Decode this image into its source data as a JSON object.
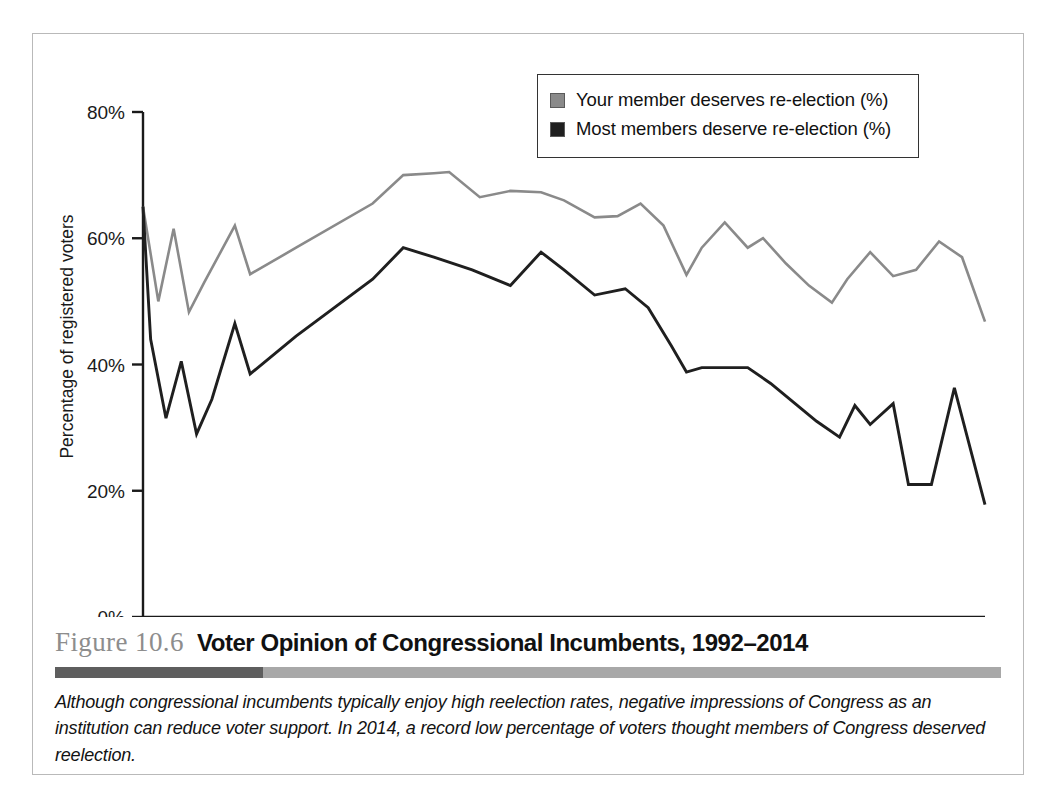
{
  "figure": {
    "number": "Figure 10.6",
    "title": "Voter Opinion of Congressional Incumbents, 1992–2014",
    "caption": "Although congressional incumbents typically enjoy high reelection rates, negative impressions of Congress as an institution can reduce voter support. In 2014, a record low percentage of voters thought members of Congress deserved reelection.",
    "rule_dark_color": "#5e5e5e",
    "rule_light_color": "#a8a8a8"
  },
  "legend": {
    "items": [
      {
        "label": "Your member deserves re-election (%)",
        "color": "#8a8a8a"
      },
      {
        "label": "Most members deserve re-election (%)",
        "color": "#1f1f1f"
      }
    ]
  },
  "chart_data": {
    "type": "line",
    "title": "Voter Opinion of Congressional Incumbents, 1992–2014",
    "xlabel": "",
    "ylabel": "Percentage of registered voters",
    "xlim": [
      1992,
      2014
    ],
    "ylim": [
      0,
      80
    ],
    "yticks": [
      0,
      20,
      40,
      60,
      80
    ],
    "ytick_labels": [
      "0%",
      "20%",
      "40%",
      "60%",
      "80%"
    ],
    "xticks": [
      1992,
      1994,
      1996,
      1998,
      2000,
      2002,
      2004,
      2006,
      2008,
      2010,
      2012,
      2014
    ],
    "xtick_labels": [
      "1992",
      "1994",
      "1996",
      "1998",
      "2000",
      "2002",
      "2004",
      "2006",
      "2008",
      "2010",
      "2012",
      "2014"
    ],
    "grid": false,
    "legend_position": "top-right",
    "series": [
      {
        "name": "Your member deserves re-election (%)",
        "color": "#8a8a8a",
        "x": [
          1992.0,
          1992.4,
          1992.8,
          1993.2,
          1993.6,
          1994.4,
          1994.8,
          1996.0,
          1998.0,
          1998.8,
          1999.6,
          2000.0,
          2000.8,
          2001.6,
          2002.4,
          2003.0,
          2003.8,
          2004.4,
          2005.0,
          2005.6,
          2006.2,
          2006.6,
          2007.2,
          2007.8,
          2008.2,
          2008.8,
          2009.4,
          2010.0,
          2010.4,
          2011.0,
          2011.6,
          2012.2,
          2012.8,
          2013.4,
          2014.0
        ],
        "y": [
          65.0,
          50.0,
          61.5,
          48.3,
          53.0,
          62.0,
          54.3,
          58.5,
          65.5,
          70.0,
          70.3,
          70.5,
          66.5,
          67.5,
          67.3,
          66.0,
          63.3,
          63.5,
          65.5,
          62.0,
          54.2,
          58.5,
          62.5,
          58.5,
          60.0,
          56.0,
          52.5,
          49.8,
          53.5,
          57.8,
          54.0,
          55.0,
          59.5,
          57.0,
          46.8
        ]
      },
      {
        "name": "Most members deserve re-election (%)",
        "color": "#1f1f1f",
        "x": [
          1992.0,
          1992.2,
          1992.6,
          1993.0,
          1993.4,
          1993.8,
          1994.4,
          1994.8,
          1996.0,
          1998.0,
          1998.8,
          1999.6,
          2000.6,
          2001.6,
          2002.4,
          2003.0,
          2003.8,
          2004.6,
          2005.2,
          2005.8,
          2006.2,
          2006.6,
          2007.2,
          2007.8,
          2008.4,
          2009.0,
          2009.6,
          2010.2,
          2010.6,
          2011.0,
          2011.6,
          2012.0,
          2012.6,
          2013.2,
          2014.0
        ],
        "y": [
          65.0,
          44.0,
          31.5,
          40.5,
          29.0,
          34.5,
          46.5,
          38.5,
          44.5,
          53.5,
          58.5,
          57.0,
          55.0,
          52.5,
          57.8,
          55.0,
          51.0,
          52.0,
          49.0,
          43.0,
          38.8,
          39.5,
          39.5,
          39.5,
          37.0,
          34.0,
          31.0,
          28.5,
          33.5,
          30.5,
          33.8,
          21.0,
          21.0,
          36.3,
          17.8
        ]
      }
    ]
  }
}
